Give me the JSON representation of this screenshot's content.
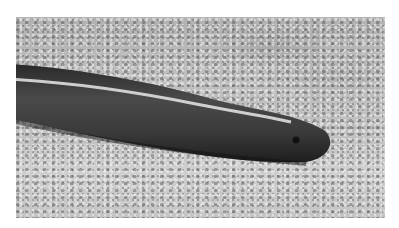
{
  "image": {
    "subject": "dark glossy legless reptile (blind snake) resting on coarse sand",
    "style": "grayscale photograph",
    "background": "sandy ground, blurred in upper region"
  },
  "colors": {
    "page_background": "#ffffff",
    "sand": "#c4c4c4",
    "snake_body": "#3a3a3a",
    "highlight": "#e8e8e8"
  }
}
